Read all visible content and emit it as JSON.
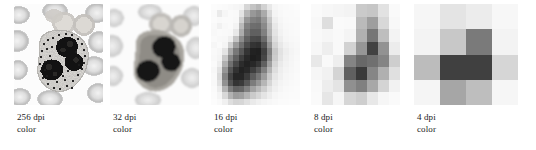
{
  "figure": {
    "background_color": "#ffffff",
    "panel_count": 5,
    "caption_font_size_px": 9
  },
  "panels": [
    {
      "id": "panel-256dpi",
      "resolution_label": "256 dpi",
      "mode_label": "color",
      "dpi": 256,
      "grid": 64,
      "x": 14,
      "y": 4,
      "width": 89,
      "height": 101,
      "caption_x": 17
    },
    {
      "id": "panel-32dpi",
      "resolution_label": "32 dpi",
      "mode_label": "color",
      "dpi": 32,
      "grid": 32,
      "x": 110,
      "y": 4,
      "width": 89,
      "height": 101,
      "caption_x": 113
    },
    {
      "id": "panel-16dpi",
      "resolution_label": "16 dpi",
      "mode_label": "color",
      "dpi": 16,
      "grid": 16,
      "x": 211,
      "y": 4,
      "width": 89,
      "height": 101,
      "caption_x": 214
    },
    {
      "id": "panel-8dpi",
      "resolution_label": "8 dpi",
      "mode_label": "color",
      "dpi": 8,
      "grid": 8,
      "x": 311,
      "y": 4,
      "width": 89,
      "height": 101,
      "caption_x": 314
    },
    {
      "id": "panel-4dpi",
      "resolution_label": "4 dpi",
      "mode_label": "color",
      "dpi": 4,
      "grid": 4,
      "x": 414,
      "y": 4,
      "width": 104,
      "height": 101,
      "caption_x": 417
    }
  ],
  "chart_data": {
    "type": "heatmap",
    "title": "",
    "xlabel": "",
    "ylabel": "",
    "colormap": "grayscale",
    "value_range": [
      0,
      255
    ],
    "legend_position": "below-each-panel",
    "grid": false,
    "panel_labels": [
      "256 dpi color",
      "32 dpi color",
      "16 dpi color",
      "8 dpi color",
      "4 dpi color"
    ],
    "grids": {
      "4dpi": {
        "size": 4,
        "values": [
          [
            246,
            228,
            236,
            247
          ],
          [
            243,
            200,
            122,
            243
          ],
          [
            188,
            64,
            64,
            214
          ],
          [
            245,
            166,
            190,
            246
          ]
        ]
      },
      "8dpi": {
        "size": 8,
        "values": [
          [
            250,
            247,
            245,
            243,
            202,
            198,
            226,
            250
          ],
          [
            248,
            222,
            250,
            249,
            186,
            158,
            216,
            248
          ],
          [
            249,
            246,
            249,
            244,
            176,
            118,
            190,
            243
          ],
          [
            247,
            238,
            249,
            210,
            150,
            66,
            146,
            236
          ],
          [
            232,
            249,
            238,
            132,
            104,
            112,
            132,
            206
          ],
          [
            246,
            241,
            212,
            96,
            58,
            134,
            176,
            224
          ],
          [
            249,
            237,
            228,
            144,
            128,
            168,
            212,
            242
          ],
          [
            250,
            230,
            246,
            214,
            206,
            232,
            246,
            250
          ]
        ]
      },
      "16dpi": {
        "size": 16,
        "values": [
          [
            252,
            251,
            250,
            248,
            246,
            244,
            214,
            196,
            184,
            210,
            232,
            246,
            249,
            250,
            251,
            252
          ],
          [
            250,
            234,
            246,
            250,
            249,
            228,
            182,
            152,
            140,
            170,
            214,
            244,
            248,
            250,
            250,
            251
          ],
          [
            251,
            249,
            250,
            250,
            248,
            208,
            150,
            128,
            122,
            150,
            198,
            238,
            246,
            249,
            250,
            250
          ],
          [
            249,
            241,
            248,
            250,
            243,
            186,
            128,
            110,
            108,
            138,
            188,
            232,
            244,
            248,
            249,
            250
          ],
          [
            248,
            250,
            249,
            248,
            232,
            172,
            116,
            96,
            96,
            128,
            182,
            228,
            242,
            247,
            249,
            250
          ],
          [
            250,
            248,
            247,
            238,
            196,
            140,
            96,
            74,
            72,
            106,
            168,
            222,
            238,
            246,
            248,
            249
          ],
          [
            246,
            250,
            244,
            206,
            154,
            112,
            74,
            52,
            48,
            82,
            148,
            212,
            232,
            242,
            246,
            248
          ],
          [
            249,
            246,
            228,
            168,
            120,
            86,
            52,
            34,
            32,
            64,
            128,
            200,
            226,
            238,
            244,
            247
          ],
          [
            248,
            244,
            200,
            136,
            96,
            62,
            40,
            30,
            34,
            70,
            136,
            204,
            228,
            240,
            245,
            248
          ],
          [
            250,
            238,
            176,
            112,
            72,
            44,
            34,
            40,
            54,
            96,
            158,
            214,
            234,
            242,
            246,
            249
          ],
          [
            247,
            226,
            150,
            86,
            50,
            34,
            40,
            62,
            86,
            128,
            180,
            222,
            238,
            244,
            247,
            249
          ],
          [
            249,
            218,
            132,
            68,
            38,
            38,
            58,
            92,
            118,
            156,
            200,
            230,
            240,
            246,
            248,
            250
          ],
          [
            248,
            224,
            146,
            84,
            52,
            58,
            86,
            124,
            150,
            182,
            214,
            236,
            244,
            247,
            249,
            250
          ],
          [
            250,
            236,
            180,
            124,
            98,
            102,
            128,
            162,
            184,
            206,
            228,
            240,
            246,
            249,
            250,
            251
          ],
          [
            251,
            244,
            216,
            178,
            156,
            160,
            180,
            202,
            214,
            228,
            238,
            246,
            249,
            250,
            251,
            251
          ],
          [
            252,
            249,
            240,
            222,
            212,
            214,
            224,
            234,
            240,
            244,
            247,
            249,
            251,
            251,
            252,
            252
          ]
        ]
      }
    }
  }
}
